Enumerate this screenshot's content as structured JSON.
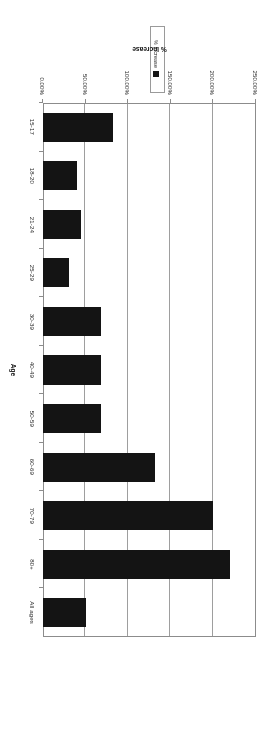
{
  "figure": {
    "legend": {
      "entries": [
        {
          "label": "% Increase",
          "color": "#141414",
          "swatch": "square-swatch"
        }
      ]
    },
    "category_axis": {
      "title": "Age"
    },
    "value_axis": {
      "title": "% Increase"
    }
  },
  "chart_data": {
    "type": "bar",
    "orientation": "horizontal",
    "title": "",
    "xlabel": "% Increase",
    "ylabel": "Age",
    "categories": [
      "All ages",
      "80+",
      "70-79",
      "60-69",
      "50-59",
      "40-49",
      "30-39",
      "25-29",
      "21-24",
      "18-20",
      "15-17"
    ],
    "series": [
      {
        "name": "% Increase",
        "color": "#141414",
        "values": [
          51,
          220,
          200,
          132,
          68,
          68,
          68,
          30,
          45,
          40,
          82
        ]
      }
    ],
    "xlim": [
      0,
      250
    ],
    "tick_labels": [
      "250.00%",
      "200.00%",
      "150.00%",
      "100.00%",
      "50.00%",
      "0.00%"
    ],
    "tick_values": [
      250,
      200,
      150,
      100,
      50,
      0
    ],
    "grid": "vertical",
    "legend_position": "above-plot",
    "value_axis_direction": "right-to-left",
    "note": "Figure is printed/scanned rotated 180 degrees"
  }
}
